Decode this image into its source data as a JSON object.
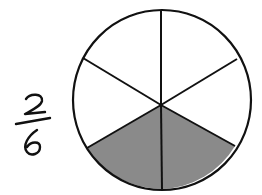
{
  "fraction": {
    "numerator": "2",
    "denominator": "6",
    "label": "2/6"
  },
  "circle": {
    "total_parts": 6,
    "shaded_parts": 2,
    "shaded_sectors": [
      "bottom-left",
      "bottom-right"
    ],
    "colors": {
      "outline": "#111111",
      "shade": "#8a8a8a",
      "background": "#ffffff"
    }
  }
}
